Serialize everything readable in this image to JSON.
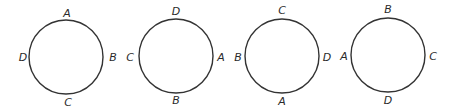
{
  "diagrams": [
    {
      "cx": 66,
      "cy": 57,
      "r": 37,
      "top": "A",
      "right": "B",
      "bottom": "C",
      "left": "D"
    },
    {
      "cx": 176,
      "cy": 56,
      "r": 37,
      "top": "D",
      "right": "A",
      "bottom": "B",
      "left": "C"
    },
    {
      "cx": 282,
      "cy": 56,
      "r": 37,
      "top": "C",
      "right": "D",
      "bottom": "A",
      "left": "B"
    },
    {
      "cx": 388,
      "cy": 55,
      "r": 37,
      "top": "B",
      "right": "C",
      "bottom": "D",
      "left": "A"
    }
  ],
  "style": {
    "stroke": "#333333",
    "text": "#2a2a2a",
    "background": "#ffffff"
  }
}
